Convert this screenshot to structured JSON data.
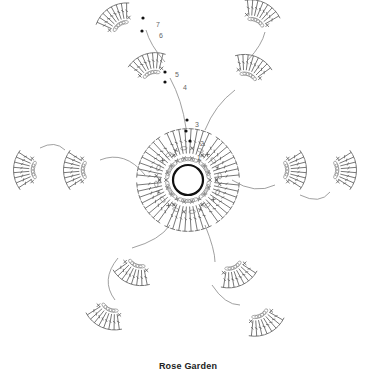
{
  "caption": "Rose Garden",
  "diagram": {
    "type": "crochet-chart",
    "center": {
      "x": 188,
      "y": 180,
      "ring_radius": 15
    },
    "colors": {
      "stitch": "#555555",
      "chain": "#999999",
      "ring": "#111111",
      "marker": "#111111",
      "label": "#666666"
    },
    "round_labels": [
      {
        "text": "1",
        "x": 197,
        "y": 160
      },
      {
        "text": "2",
        "x": 200,
        "y": 146
      },
      {
        "text": "3",
        "x": 195,
        "y": 127
      },
      {
        "text": "4",
        "x": 183,
        "y": 90
      },
      {
        "text": "5",
        "x": 175,
        "y": 77
      },
      {
        "text": "6",
        "x": 159,
        "y": 38
      },
      {
        "text": "7",
        "x": 156,
        "y": 27
      }
    ],
    "inner_rounds": {
      "single_crochet_ring1": 18,
      "single_crochet_ring2": 24
    },
    "inner_petals": 6,
    "outer_petals": 12,
    "petal_stitches": {
      "double_crochet_per_fan": 8,
      "chain_loops_per_fan": 5
    }
  }
}
